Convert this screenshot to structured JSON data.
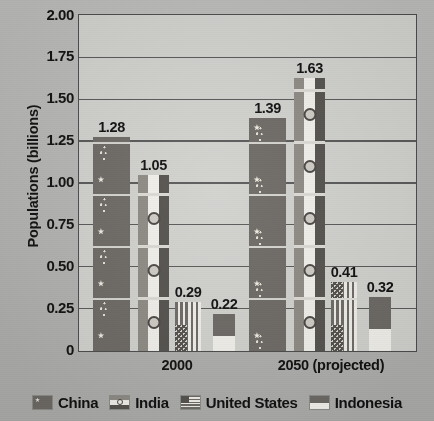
{
  "chart_data": {
    "type": "bar",
    "title": "",
    "xlabel": "",
    "ylabel": "Populations (billions)",
    "ylim": [
      0,
      2.0
    ],
    "yticks": [
      "2.00",
      "1.75",
      "1.50",
      "1.25",
      "1.00",
      "0.75",
      "0.50",
      "0.25",
      "0"
    ],
    "ytick_values": [
      2.0,
      1.75,
      1.5,
      1.25,
      1.0,
      0.75,
      0.5,
      0.25,
      0
    ],
    "grid": "horizontal",
    "legend_position": "bottom",
    "categories": [
      "2000",
      "2050 (projected)"
    ],
    "series": [
      {
        "name": "China",
        "values": [
          1.28,
          1.39
        ],
        "labels": [
          "1.28",
          "1.39"
        ],
        "pattern": "flag-china"
      },
      {
        "name": "India",
        "values": [
          1.05,
          1.63
        ],
        "labels": [
          "1.05",
          "1.63"
        ],
        "pattern": "flag-india"
      },
      {
        "name": "United States",
        "values": [
          0.29,
          0.41
        ],
        "labels": [
          "0.29",
          "0.41"
        ],
        "pattern": "flag-usa"
      },
      {
        "name": "Indonesia",
        "values": [
          0.22,
          0.32
        ],
        "labels": [
          "0.22",
          "0.32"
        ],
        "pattern": "flag-indonesia"
      }
    ]
  },
  "axis": {
    "y_title": "Populations (billions)",
    "tick_2_00": "2.00",
    "tick_1_75": "1.75",
    "tick_1_50": "1.50",
    "tick_1_25": "1.25",
    "tick_1_00": "1.00",
    "tick_0_75": "0.75",
    "tick_0_50": "0.50",
    "tick_0_25": "0.25",
    "tick_0": "0"
  },
  "xaxis": {
    "cat_2000": "2000",
    "cat_2050": "2050 (projected)"
  },
  "bar_labels": {
    "china_2000": "1.28",
    "india_2000": "1.05",
    "usa_2000": "0.29",
    "indonesia_2000": "0.22",
    "china_2050": "1.39",
    "india_2050": "1.63",
    "usa_2050": "0.41",
    "indonesia_2050": "0.32"
  },
  "legend": {
    "items": [
      {
        "label": "China",
        "swatch": "china-flag-icon"
      },
      {
        "label": "India",
        "swatch": "india-flag-icon"
      },
      {
        "label": "United States",
        "swatch": "usa-flag-icon"
      },
      {
        "label": "Indonesia",
        "swatch": "indonesia-flag-icon"
      }
    ]
  },
  "colors": {
    "plot_background": "#d2d2cf",
    "figure_background": "#b9b9b7",
    "axis": "#4d4d4d",
    "gridline": "#5a5a5a",
    "text": "#111111"
  }
}
